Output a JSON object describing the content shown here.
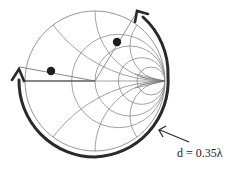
{
  "diagram": {
    "type": "smith-chart",
    "annotation": {
      "distance_label": "d = 0.35λ"
    },
    "points": [
      {
        "name": "load-point",
        "description": "dot inside chart, left side"
      },
      {
        "name": "transformed-point",
        "description": "dot inside chart, upper right"
      }
    ],
    "arrows": [
      {
        "name": "rotation-arc-arrow",
        "description": "thick arc around chart from lower-right up the left to top",
        "direction": "clockwise toward generator"
      },
      {
        "name": "pointer-arrow",
        "description": "arrow pointing from label to the arc"
      }
    ],
    "colors": {
      "background": "#ffffff",
      "grid": "#8a8a8a",
      "arc": "#2a2a2a",
      "dot": "#1e1e1e",
      "text": "#222222"
    }
  }
}
